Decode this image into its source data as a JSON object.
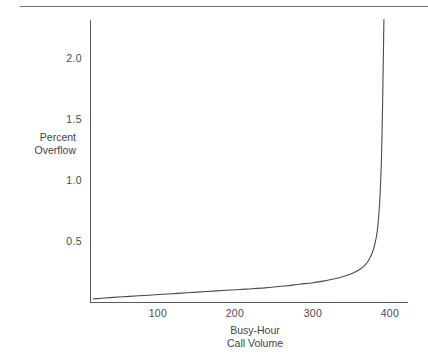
{
  "chart_data": {
    "type": "line",
    "title": "",
    "xlabel": "Busy-Hour Call Volume",
    "xlabel_lines": [
      "Busy-Hour",
      "Call Volume"
    ],
    "ylabel": "Percent Overflow",
    "ylabel_lines": [
      "Percent",
      "Overflow"
    ],
    "xlim": [
      0,
      415
    ],
    "ylim": [
      0,
      2.32
    ],
    "grid": false,
    "legend": null,
    "xticks": [
      100,
      200,
      300,
      400
    ],
    "xtick_labels": [
      "100",
      "200",
      "300",
      "400"
    ],
    "yticks": [
      0.5,
      1.0,
      1.5,
      2.0
    ],
    "ytick_labels": [
      "0.5",
      "1.0",
      "1.5",
      "2.0"
    ],
    "series": [
      {
        "name": "Percent Overflow",
        "color": "#4a4a4a",
        "x": [
          4,
          25,
          50,
          75,
          100,
          125,
          150,
          175,
          200,
          225,
          250,
          270,
          285,
          300,
          312,
          322,
          332,
          340,
          347,
          353,
          358,
          362,
          365,
          368,
          370,
          372,
          373.5,
          375,
          376,
          377,
          377.8,
          378.3
        ],
        "y": [
          0.03,
          0.04,
          0.05,
          0.06,
          0.07,
          0.08,
          0.09,
          0.1,
          0.11,
          0.12,
          0.135,
          0.15,
          0.16,
          0.175,
          0.19,
          0.205,
          0.225,
          0.245,
          0.27,
          0.3,
          0.34,
          0.39,
          0.44,
          0.52,
          0.6,
          0.74,
          0.9,
          1.15,
          1.42,
          1.78,
          2.1,
          2.32
        ]
      }
    ],
    "annotations": []
  },
  "figure": {
    "top_rule": "horizontal-rule",
    "background_color": "#ffffff",
    "axis_color": "#5a5a5a",
    "curve_color": "#4a4a4a"
  }
}
